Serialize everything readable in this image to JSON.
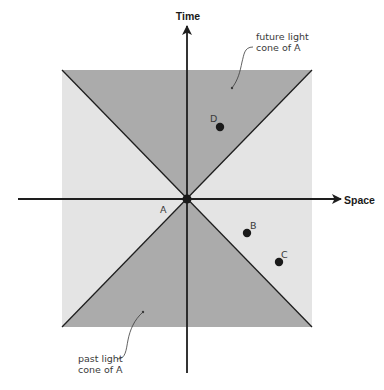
{
  "diagram": {
    "axes": {
      "x_label": "Space",
      "y_label": "Time"
    },
    "regions": {
      "future_cone_label_line1": "future light",
      "future_cone_label_line2": "cone of A",
      "past_cone_label_line1": "past light",
      "past_cone_label_line2": "cone of A"
    },
    "events": [
      {
        "id": "A",
        "label": "A",
        "location": "origin"
      },
      {
        "id": "B",
        "label": "B",
        "location": "outside cones, lower right"
      },
      {
        "id": "C",
        "label": "C",
        "location": "outside cones, lower right"
      },
      {
        "id": "D",
        "label": "D",
        "location": "inside future light cone"
      }
    ],
    "colors": {
      "cone_fill": "#ababab",
      "elsewhere_fill": "#e4e4e4",
      "background": "#ffffff",
      "lines": "#1e1e1e",
      "dots": "#1a1a1a"
    }
  }
}
